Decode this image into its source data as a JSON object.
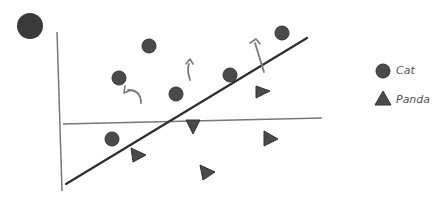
{
  "diagram": {
    "title_marker": {
      "shape": "circle",
      "cx": 30,
      "cy": 26,
      "r": 13,
      "color": "#3a3a3a"
    },
    "colors": {
      "marker_fill": "#4a4a4a",
      "marker_stroke": "#333333",
      "line": "#2e2e2e",
      "axis": "#777777",
      "arrow": "#7a7a7a"
    },
    "axes": {
      "vertical": {
        "x1": 57,
        "y1": 32,
        "x2": 62,
        "y2": 191
      },
      "horizontal": {
        "x1": 63,
        "y1": 124,
        "x2": 322,
        "y2": 118
      }
    },
    "decision_line": {
      "x1": 66,
      "y1": 184,
      "x2": 307,
      "y2": 38
    },
    "cats": [
      {
        "cx": 149,
        "cy": 46
      },
      {
        "cx": 119,
        "cy": 78
      },
      {
        "cx": 176,
        "cy": 94
      },
      {
        "cx": 230,
        "cy": 75
      },
      {
        "cx": 282,
        "cy": 33
      },
      {
        "cx": 112,
        "cy": 139
      }
    ],
    "pandas": [
      {
        "points": "256,86 256,98 270,91"
      },
      {
        "points": "186,120 200,120 193,134"
      },
      {
        "points": "131,148 133,162 146,155"
      },
      {
        "points": "264,131 264,146 278,139"
      },
      {
        "points": "200,165 203,180 215,172"
      }
    ],
    "arrows": [
      {
        "path": "M 141 103 C 141 94, 136 90, 128 90",
        "head": "125,86 124,93 131,90"
      },
      {
        "path": "M 190 80 C 188 74, 187 69, 189 64",
        "head": "186,64 190,59 193,64"
      },
      {
        "path": "M 264 72 L 255 43",
        "head": "250,43 256,39 260,44"
      }
    ]
  },
  "legend": {
    "items": [
      {
        "label": "Cat",
        "shape": "circle"
      },
      {
        "label": "Panda",
        "shape": "triangle"
      }
    ]
  }
}
